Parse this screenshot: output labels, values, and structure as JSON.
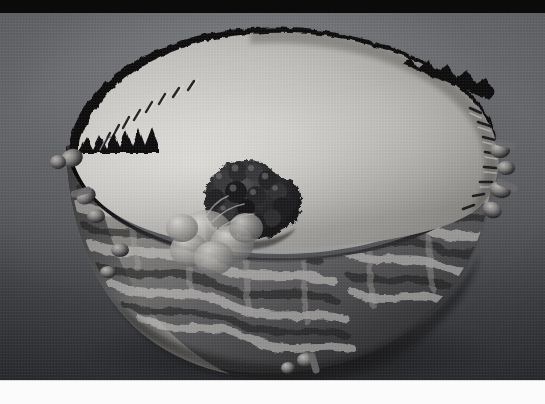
{
  "image": {
    "kind": "scientific-3d-illustration",
    "subject": "eukaryotic cell nucleus, cutaway view",
    "rendering": "grayscale / monochrome 3D render",
    "width_px": 545,
    "height_px": 404,
    "caption": "",
    "alt_text": "Grayscale 3D illustration of a cell nucleus cut open, showing the nuclear envelope studded with nuclear pores, a rough endoplasmic reticulum surface covered in ribosomes, a dark nucleolus, and a DNA double helix unwinding out of the nucleus."
  },
  "layout": {
    "letterbox_top": {
      "label": "black bar",
      "top": 0,
      "height": 13,
      "color": "#0b0b0c"
    },
    "letterbox_bottom": {
      "label": "white bar",
      "top": 381,
      "height": 23,
      "color": "#fbfbfb"
    },
    "artwork_area": {
      "top": 13,
      "height": 368
    }
  },
  "palette": {
    "letterbox_black": "#0b0b0c",
    "letterbox_white": "#fbfbfb",
    "background_top": "#6e6f73",
    "background_bottom": "#303135",
    "nucleoplasm_light": "#d8d6d2",
    "nucleoplasm_mid": "#b7b5b1",
    "nucleoplasm_shadow": "#8e8c89",
    "envelope_dark": "#121214",
    "er_surface_light": "#cfcdc9",
    "er_surface_mid": "#8d8b88",
    "er_surface_dark": "#2a2a2c",
    "nucleolus_dark": "#1b1b1d",
    "nucleolus_highlight": "#6a6a6b",
    "dna_light": "#e6e4e0",
    "dna_shadow": "#4a4a4c"
  },
  "features": [
    {
      "id": "nuclear-envelope",
      "name": "Nuclear envelope",
      "description": "Double membrane forming the dome of the nucleus; the cut rim shows a ruffled, folded edge."
    },
    {
      "id": "nucleoplasm",
      "name": "Nucleoplasm",
      "description": "Pale interior surface of the sectioned nucleus, lit from upper left.",
      "speck_count": 96
    },
    {
      "id": "nuclear-pores",
      "name": "Nuclear pore complexes",
      "description": "Small dark elliptical openings scattered across the nuclear envelope surface."
    },
    {
      "id": "rough-er",
      "name": "Rough endoplasmic reticulum",
      "description": "Lower outer wall covered in a tangled tubular network studded with ribosome spheres.",
      "ribosome_count": 140
    },
    {
      "id": "nucleolus",
      "name": "Nucleolus",
      "description": "Dense dark cauliflower-like mass sitting against the inner wall of the nucleus."
    },
    {
      "id": "chromatin-granules",
      "name": "Chromatin / granular bodies",
      "description": "Soft translucent lobed masses next to the nucleolus where the DNA strand originates."
    },
    {
      "id": "dna-helix",
      "name": "DNA double helix",
      "description": "Twisted ladder strand unwinding from the nucleolus region and trailing toward the lower left."
    },
    {
      "id": "er-tubules",
      "name": "ER tubules",
      "description": "Short rounded tubes and vesicles protruding outward from the nuclear rim."
    }
  ],
  "lighting": {
    "key_light_direction": "upper-left",
    "shadow_direction": "lower-right",
    "contrast": "high"
  }
}
